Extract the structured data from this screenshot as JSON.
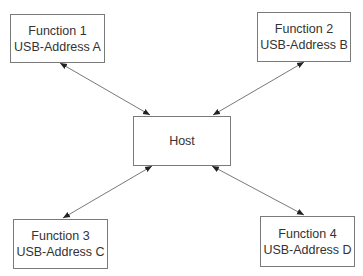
{
  "nodes": {
    "host": {
      "label": "Host"
    },
    "f1": {
      "line1": "Function 1",
      "line2": "USB-Address A"
    },
    "f2": {
      "line1": "Function 2",
      "line2": "USB-Address B"
    },
    "f3": {
      "line1": "Function 3",
      "line2": "USB-Address C"
    },
    "f4": {
      "line1": "Function 4",
      "line2": "USB-Address D"
    }
  },
  "edges": [
    {
      "from": "f1",
      "to": "host",
      "direction": "bidirectional"
    },
    {
      "from": "f2",
      "to": "host",
      "direction": "bidirectional"
    },
    {
      "from": "f3",
      "to": "host",
      "direction": "bidirectional"
    },
    {
      "from": "f4",
      "to": "host",
      "direction": "bidirectional"
    }
  ],
  "colors": {
    "border": "#7a7a7a",
    "arrow": "#555555",
    "text": "#333333"
  }
}
